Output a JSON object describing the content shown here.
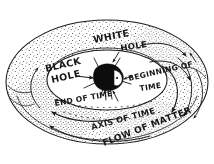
{
  "figure": {
    "title_present": false,
    "medium": "hand-drawn pen and ink sketch",
    "background_color": "#ffffff",
    "ink_color": "#1a1a1a",
    "singularity_color": "#0d0d0d"
  },
  "labels": {
    "black_hole": "BLACK HOLE",
    "black_hole_line1": "BLACK",
    "black_hole_line2": "HOLE",
    "white_hole": "WHITE HOLE",
    "white_hole_line1": "WHITE",
    "white_hole_line2": "HOLE",
    "beginning_of_time": "BEGINNING OF TIME",
    "beginning_of_time_line1": "BEGINNING OF",
    "beginning_of_time_line2": "TIME",
    "end_of_time": "END OF TIME",
    "axis_of_time": "AXIS OF TIME",
    "flow_of_matter": "FLOW OF MATTER"
  },
  "elements": {
    "singularity_name": "central black blob singularity",
    "torus_name": "stippled torus body",
    "inner_hole_name": "torus inner opening"
  }
}
